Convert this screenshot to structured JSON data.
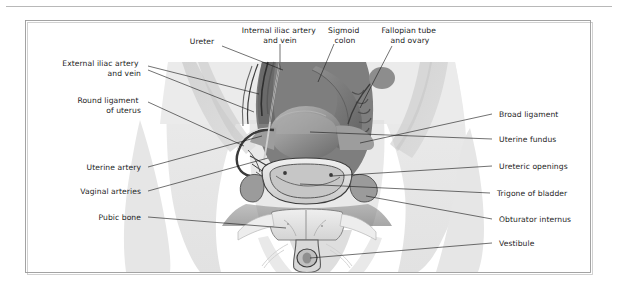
{
  "figure": {
    "style": "grayscale medical illustration",
    "border_color": "#9a9a9a",
    "background_color": "#ffffff",
    "text_color": "#1d1d1d",
    "leader_color": "#1a1a1a"
  },
  "labels": {
    "top": [
      {
        "id": "ureter",
        "text": "Ureter",
        "lines": [
          "Ureter"
        ]
      },
      {
        "id": "internal-iliac-artery-and-vein",
        "text": "Internal iliac artery and vein",
        "lines": [
          "Internal iliac artery",
          "and vein"
        ]
      },
      {
        "id": "sigmoid-colon",
        "text": "Sigmoid colon",
        "lines": [
          "Sigmoid",
          "colon"
        ]
      },
      {
        "id": "fallopian-tube-and-ovary",
        "text": "Fallopian tube and ovary",
        "lines": [
          "Fallopian tube",
          "and ovary"
        ]
      }
    ],
    "left": [
      {
        "id": "external-iliac-artery-and-vein",
        "text": "External iliac artery and vein",
        "lines": [
          "External iliac artery",
          "and vein"
        ]
      },
      {
        "id": "round-ligament-of-uterus",
        "text": "Round ligament of uterus",
        "lines": [
          "Round ligament",
          "of uterus"
        ]
      },
      {
        "id": "uterine-artery",
        "text": "Uterine artery",
        "lines": [
          "Uterine artery"
        ]
      },
      {
        "id": "vaginal-arteries",
        "text": "Vaginal arteries",
        "lines": [
          "Vaginal arteries"
        ]
      },
      {
        "id": "pubic-bone",
        "text": "Pubic bone",
        "lines": [
          "Pubic bone"
        ]
      }
    ],
    "right": [
      {
        "id": "broad-ligament",
        "text": "Broad ligament",
        "lines": [
          "Broad ligament"
        ]
      },
      {
        "id": "uterine-fundus",
        "text": "Uterine fundus",
        "lines": [
          "Uterine fundus"
        ]
      },
      {
        "id": "ureteric-openings",
        "text": "Ureteric openings",
        "lines": [
          "Ureteric openings"
        ]
      },
      {
        "id": "trigone-of-bladder",
        "text": "Trigone of bladder",
        "lines": [
          "Trigone of bladder"
        ]
      },
      {
        "id": "obturator-internus",
        "text": "Obturator internus",
        "lines": [
          "Obturator internus"
        ]
      },
      {
        "id": "vestibule",
        "text": "Vestibule",
        "lines": [
          "Vestibule"
        ]
      }
    ]
  }
}
